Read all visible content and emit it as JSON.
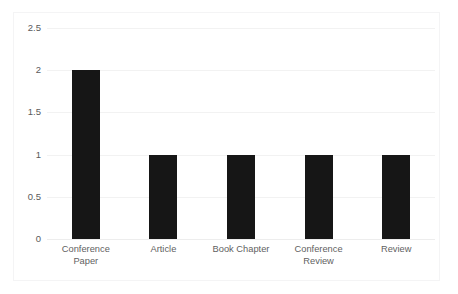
{
  "chart_data": {
    "type": "bar",
    "title": "",
    "subtitle": "",
    "xlabel": "",
    "ylabel": "",
    "categories": [
      "Conference Paper",
      "Article",
      "Book Chapter",
      "Conference Review",
      "Review"
    ],
    "values": [
      2,
      1,
      1,
      1,
      1
    ],
    "ylim": [
      0,
      2.5
    ],
    "ytick_labels": [
      "0",
      "0.5",
      "1",
      "1.5",
      "2",
      "2.5"
    ],
    "ytick_values": [
      0,
      0.5,
      1,
      1.5,
      2,
      2.5
    ],
    "grid": true,
    "grid_axis": "y",
    "legend": false,
    "legend_position": "none",
    "bar_color": "#161616",
    "grid_color": "#f2f2f2",
    "axis_text_color": "#5a5a5a",
    "background_color": "#ffffff",
    "border_color": "#f4f4f5"
  }
}
